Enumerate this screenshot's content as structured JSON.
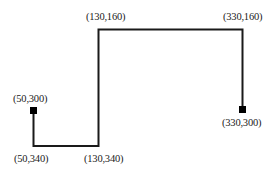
{
  "diagram": {
    "type": "polyline-path",
    "stroke_color": "#1a1a1a",
    "marker_color": "#000000",
    "points": [
      {
        "label": "(50,300)",
        "x": 50,
        "y": 300,
        "endpoint": true
      },
      {
        "label": "(50,340)",
        "x": 50,
        "y": 340,
        "endpoint": false
      },
      {
        "label": "(130,340)",
        "x": 130,
        "y": 340,
        "endpoint": false
      },
      {
        "label": "(130,160)",
        "x": 130,
        "y": 160,
        "endpoint": false
      },
      {
        "label": "(330,160)",
        "x": 330,
        "y": 160,
        "endpoint": false
      },
      {
        "label": "(330,300)",
        "x": 330,
        "y": 300,
        "endpoint": true
      }
    ],
    "labels": {
      "p_50_300": "(50,300)",
      "p_50_340": "(50,340)",
      "p_130_340": "(130,340)",
      "p_130_160": "(130,160)",
      "p_330_160": "(330,160)",
      "p_330_300": "(330,300)"
    }
  }
}
